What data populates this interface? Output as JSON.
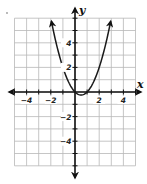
{
  "chart_data": {
    "type": "line",
    "title": "",
    "function": "y = x^2 - x",
    "xlabel": "x",
    "ylabel": "y",
    "xlim": [
      -5,
      5
    ],
    "ylim": [
      -6,
      6
    ],
    "grid": true,
    "grid_step": 1,
    "x_tick_labels": [
      "−4",
      "−2",
      "2",
      "4"
    ],
    "x_tick_values": [
      -4,
      -2,
      2,
      4
    ],
    "y_tick_labels": [
      "4",
      "2",
      "−2",
      "−4"
    ],
    "y_tick_values": [
      4,
      2,
      -2,
      -4
    ],
    "series": [
      {
        "name": "parabola",
        "x": [
          -1.95,
          -1.5,
          -1,
          -0.5,
          0,
          0.25,
          0.5,
          0.75,
          1,
          1.5,
          2,
          2.5,
          2.95
        ],
        "y": [
          5.75,
          3.75,
          2,
          0.75,
          0,
          -0.1875,
          -0.25,
          -0.1875,
          0,
          0.75,
          2,
          3.75,
          5.75
        ],
        "arrows": "both ends"
      }
    ],
    "key_points": {
      "x_intercepts": [
        [
          0,
          0
        ],
        [
          1,
          0
        ]
      ],
      "vertex": [
        0.5,
        -0.25
      ]
    }
  },
  "axes": {
    "x_name": "x",
    "y_name": "y"
  },
  "colors": {
    "grid": "#b8b8b8",
    "axis": "#111111",
    "curve": "#1a1a1a",
    "background": "#ffffff"
  }
}
